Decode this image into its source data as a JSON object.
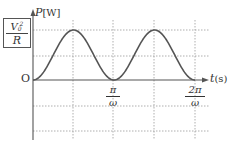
{
  "chart_data": {
    "type": "line",
    "title": "",
    "xlabel": "t [s]",
    "ylabel": "P [W]",
    "origin_label": "O",
    "y_tick_label": {
      "numerator": "V",
      "subscript": "0",
      "superscript": "2",
      "denominator": "R"
    },
    "x_tick_labels": [
      {
        "numerator": "π",
        "denominator": "ω",
        "value_rad_over_omega": 3.14159
      },
      {
        "numerator": "2π",
        "denominator": "ω",
        "value_rad_over_omega": 6.28318
      }
    ],
    "function": "P(t) = (V0^2/R) * sin^2(ωt)",
    "x": [
      0,
      0.785,
      1.571,
      2.356,
      3.142,
      3.927,
      4.712,
      5.498,
      6.283
    ],
    "x_unit": "ωt (rad)",
    "values": [
      0,
      0.5,
      1,
      0.5,
      0,
      0.5,
      1,
      0.5,
      0
    ],
    "y_unit": "fraction of V0^2/R",
    "ylim": [
      -1,
      1.2
    ],
    "xlim": [
      0,
      6.6
    ],
    "grid": {
      "style": "dotted",
      "vertical_at": [
        1.571,
        3.142,
        4.712,
        6.283
      ],
      "horizontal_at": [
        1,
        0.5,
        -0.5,
        -1
      ]
    },
    "legend": null
  },
  "labels": {
    "y_axis": "P",
    "y_unit": "[W]",
    "x_axis": "t",
    "x_unit": "(s)",
    "origin": "O",
    "amp_num": "V",
    "amp_sub": "0",
    "amp_sup": "2",
    "amp_den": "R",
    "tick1_num": "π",
    "tick1_den": "ω",
    "tick2_num": "2π",
    "tick2_den": "ω"
  },
  "colors": {
    "curve": "#555555",
    "axis": "#555555",
    "grid": "#999999",
    "text": "#333333"
  }
}
